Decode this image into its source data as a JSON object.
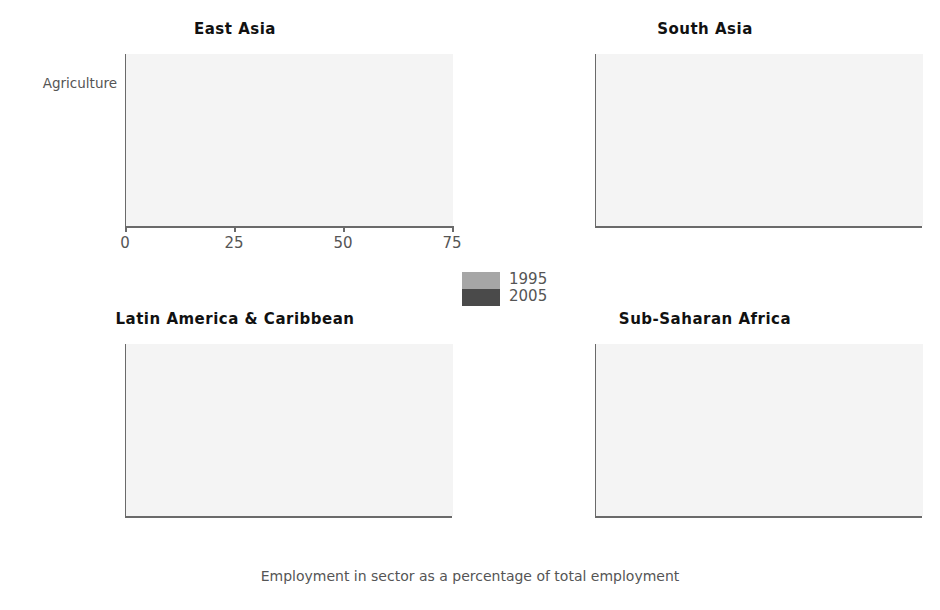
{
  "chart_data": {
    "type": "bar",
    "orientation": "horizontal",
    "title": "",
    "xlabel": "Employment in sector as a percentage of total employment",
    "ylabel": "",
    "xlim": [
      0,
      75
    ],
    "xticks": [
      0,
      25,
      50,
      75
    ],
    "xtick_labels": [
      "0",
      "25",
      "50",
      "75"
    ],
    "grid": false,
    "legend": {
      "position": "center",
      "entries": [
        {
          "name": "1995",
          "color": "#a6a6a6"
        },
        {
          "name": "2005",
          "color": "#4a4a4a"
        }
      ]
    },
    "categories": [
      "Agriculture",
      "Industry",
      "Services"
    ],
    "panels": [
      {
        "title": "East Asia",
        "series": [
          {
            "name": "1995",
            "values": [
              54.4,
              25.8,
              20.0
            ]
          },
          {
            "name": "2005",
            "values": [
              48.8,
              26.3,
              24.5
            ]
          }
        ]
      },
      {
        "title": "South Asia",
        "series": [
          {
            "name": "1995",
            "values": [
              64.0,
              13.5,
              22.8
            ]
          },
          {
            "name": "2005",
            "values": [
              61.3,
              14.5,
              24.5
            ]
          }
        ]
      },
      {
        "title": "Latin America & Caribbean",
        "series": [
          {
            "name": "1995",
            "values": [
              23.0,
              20.0,
              56.5
            ]
          },
          {
            "name": "2005",
            "values": [
              17.3,
              20.2,
              62.3
            ]
          }
        ]
      },
      {
        "title": "Sub-Saharan Africa",
        "series": [
          {
            "name": "1995",
            "values": [
              70.0,
              8.2,
              21.5
            ]
          },
          {
            "name": "2005",
            "values": [
              65.8,
              9.2,
              27.5
            ]
          }
        ]
      }
    ]
  },
  "panels": {
    "east_asia": {
      "title": "East Asia"
    },
    "south_asia": {
      "title": "South Asia"
    },
    "latin_america": {
      "title": "Latin America & Caribbean"
    },
    "sub_saharan_africa": {
      "title": "Sub-Saharan Africa"
    }
  },
  "axis": {
    "xlabel": "Employment in sector as a percentage of total employment",
    "ticks": [
      "0",
      "25",
      "50",
      "75"
    ],
    "categories": [
      "Agriculture",
      "Industry",
      "Services"
    ]
  },
  "legend": {
    "items": [
      {
        "label": "1995"
      },
      {
        "label": "2005"
      }
    ]
  },
  "colors": {
    "series_1995": "#a6a6a6",
    "series_2005": "#4a4a4a",
    "plot_background": "#f4f4f4",
    "axis": "#6a6a6a",
    "text": "#555555",
    "title_text": "#111111"
  }
}
